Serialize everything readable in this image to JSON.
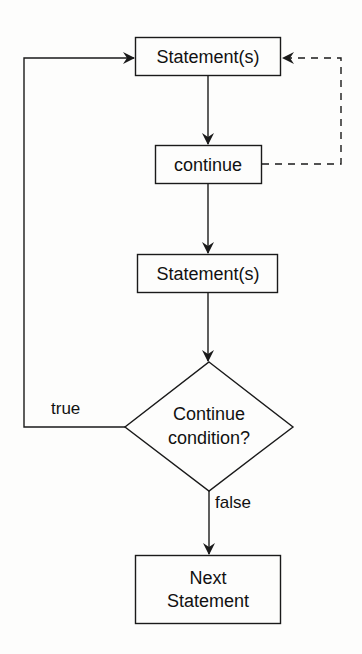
{
  "diagram": {
    "type": "flowchart",
    "title": "",
    "colors": {
      "stroke": "#1a1a1a",
      "text": "#111111",
      "background": "#fdfdfc"
    },
    "nodes": [
      {
        "id": "stmt1",
        "shape": "rect",
        "lines": [
          "Statement(s)"
        ]
      },
      {
        "id": "continue",
        "shape": "rect",
        "lines": [
          "continue"
        ]
      },
      {
        "id": "stmt2",
        "shape": "rect",
        "lines": [
          "Statement(s)"
        ]
      },
      {
        "id": "cond",
        "shape": "diamond",
        "lines": [
          "Continue",
          "condition?"
        ]
      },
      {
        "id": "next",
        "shape": "rect",
        "lines": [
          "Next",
          "Statement"
        ]
      }
    ],
    "edges": [
      {
        "from": "stmt1",
        "to": "continue",
        "style": "solid",
        "label": ""
      },
      {
        "from": "continue",
        "to": "stmt1",
        "style": "dashed",
        "label": ""
      },
      {
        "from": "continue",
        "to": "stmt2",
        "style": "solid",
        "label": ""
      },
      {
        "from": "stmt2",
        "to": "cond",
        "style": "solid",
        "label": ""
      },
      {
        "from": "cond",
        "to": "stmt1",
        "style": "solid",
        "label": "true"
      },
      {
        "from": "cond",
        "to": "next",
        "style": "solid",
        "label": "false"
      }
    ]
  }
}
